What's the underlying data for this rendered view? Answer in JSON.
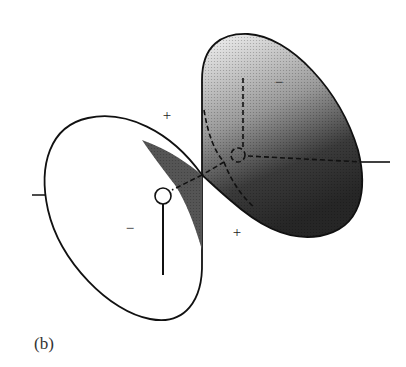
{
  "figure": {
    "label": "(b)",
    "signs": {
      "upper_left": "+",
      "upper_right_lobe": "−",
      "left_lobe": "−",
      "lower_right": "+"
    },
    "colors": {
      "line": "#111111",
      "shade_dark": "#2a2a2a",
      "shade_light": "#f2f2f2",
      "background": "#ffffff"
    }
  }
}
